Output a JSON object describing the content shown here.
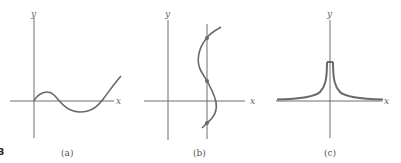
{
  "figure": {
    "number_fragment": "3",
    "panels": [
      {
        "id": "a",
        "caption": "(a)",
        "x_label": "x",
        "y_label": "y",
        "description": "cubic-like curve through origin: rises to local max, dips below x-axis, rises steeply"
      },
      {
        "id": "b",
        "caption": "(b)",
        "x_label": "x",
        "y_label": "y",
        "description": "S-shaped curve (not a function) crossed by a vertical line at three marked points"
      },
      {
        "id": "c",
        "caption": "(c)",
        "x_label": "x",
        "y_label": "y",
        "description": "symmetric cusp-shaped curve peaking at the y-axis, approaching the x-axis asymptotically"
      }
    ]
  },
  "colors": {
    "axis": "#6e6e6e",
    "curve": "#6a6a6a",
    "text": "#555555"
  }
}
